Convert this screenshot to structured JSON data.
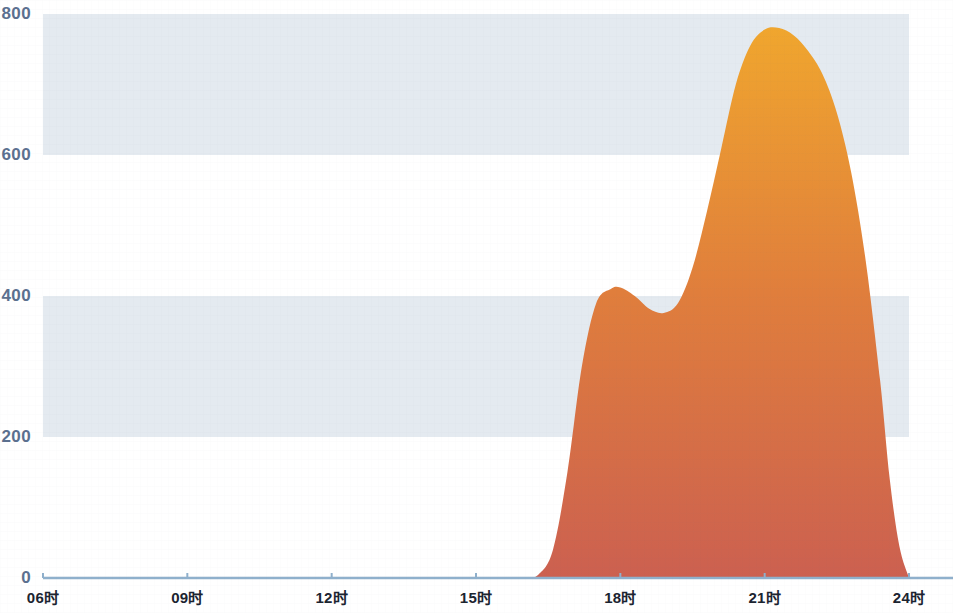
{
  "chart_data": {
    "type": "area",
    "title": "",
    "subtitle": "",
    "xlabel": "",
    "ylabel": "",
    "xlim": [
      6,
      24
    ],
    "ylim": [
      0,
      800
    ],
    "grid": false,
    "banded_background": true,
    "legend": "none",
    "y_ticks": [
      0,
      200,
      400,
      600,
      800
    ],
    "y_tick_labels": [
      "0",
      "200",
      "400",
      "600",
      "800"
    ],
    "x_ticks": [
      6,
      9,
      12,
      15,
      18,
      21,
      24
    ],
    "x_tick_labels": [
      "06时",
      "09时",
      "12时",
      "15时",
      "18时",
      "21时",
      "24时"
    ],
    "series": [
      {
        "name": "",
        "x": [
          6.0,
          7.0,
          8.0,
          9.0,
          10.0,
          11.0,
          12.0,
          13.0,
          14.0,
          15.0,
          15.5,
          16.0,
          16.3,
          16.6,
          16.9,
          17.2,
          17.5,
          17.8,
          18.0,
          18.3,
          18.6,
          18.9,
          19.2,
          19.5,
          19.8,
          20.1,
          20.4,
          20.7,
          21.0,
          21.3,
          21.6,
          21.9,
          22.2,
          22.5,
          22.8,
          23.1,
          23.4,
          23.6,
          23.8,
          24.0
        ],
        "values": [
          0,
          0,
          0,
          0,
          0,
          0,
          0,
          0,
          0,
          0,
          0,
          0,
          5,
          40,
          150,
          300,
          390,
          410,
          412,
          400,
          382,
          376,
          390,
          440,
          520,
          610,
          700,
          755,
          778,
          780,
          770,
          748,
          715,
          660,
          575,
          450,
          280,
          140,
          45,
          0
        ]
      }
    ],
    "peaks": [
      {
        "x": 18.0,
        "y": 412,
        "label": "local maximum"
      },
      {
        "x": 18.9,
        "y": 376,
        "label": "local minimum"
      },
      {
        "x": 21.2,
        "y": 780,
        "label": "global maximum"
      }
    ],
    "colors": {
      "fill_top": "#F0A62E",
      "fill_bottom": "#CC6050",
      "band": "#E4EAF0",
      "axis_line": "#8FB0CC",
      "y_label": "#5B708F",
      "x_label": "#1b2430",
      "background": "#FFFFFF"
    }
  }
}
